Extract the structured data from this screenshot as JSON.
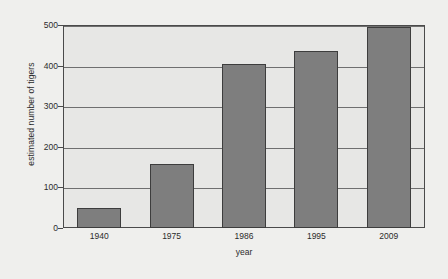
{
  "chart_data": {
    "type": "bar",
    "title": "",
    "xlabel": "year",
    "ylabel": "estimated number of tigers",
    "categories": [
      "1940",
      "1975",
      "1986",
      "1995",
      "2009"
    ],
    "values": [
      50,
      157,
      405,
      435,
      495
    ],
    "ylim": [
      0,
      500
    ],
    "yticks": [
      0,
      100,
      200,
      300,
      400,
      500
    ],
    "ytick_labels": [
      "0",
      "100",
      "200",
      "300",
      "400",
      "500"
    ],
    "grid": true,
    "legend": null,
    "colors": {
      "bar_fill": "#7e7e7e",
      "bar_edge": "#3d3d3d",
      "plot_background": "#e7e7e5",
      "page_background": "#efefed",
      "gridline": "#6f6f6f",
      "axis": "#4a4a4a",
      "text": "#2b2b2b"
    }
  }
}
